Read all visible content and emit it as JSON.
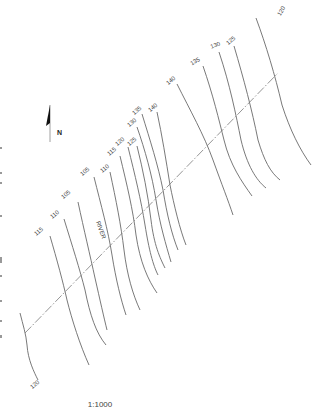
{
  "map": {
    "title": "Topographic contour map with cross-section line",
    "north_label": "N",
    "scale_label": "1:1000",
    "river_label": "RIVER",
    "colors": {
      "contour": "#6a6a6a",
      "section_line": "#7a7a7a",
      "label": "#444444"
    },
    "section_line": {
      "x1": 25,
      "y1": 333,
      "x2": 278,
      "y2": 73
    },
    "contours": [
      {
        "id": "c120-top",
        "label": "120",
        "lx": 283,
        "ly": 12,
        "rot": -60,
        "d": "M256,18 C266,45 275,75 282,105 C290,130 300,150 311,165"
      },
      {
        "id": "c125-top",
        "label": "125",
        "lx": 232,
        "ly": 42,
        "rot": -40,
        "d": "M234,46 C244,80 252,110 258,140 C264,160 270,172 280,180"
      },
      {
        "id": "c130-top",
        "label": "130",
        "lx": 216,
        "ly": 47,
        "rot": -20,
        "d": "M219,52 C230,85 236,115 241,140 C247,165 256,180 266,188"
      },
      {
        "id": "c135-top",
        "label": "135",
        "lx": 196,
        "ly": 63,
        "rot": -30,
        "d": "M203,66 C213,95 219,120 224,140 C230,165 242,182 252,196"
      },
      {
        "id": "c140-top",
        "label": "140",
        "lx": 172,
        "ly": 82,
        "rot": -40,
        "d": "M177,84 C190,110 204,135 213,160 C222,185 228,200 233,215"
      },
      {
        "id": "c140-mid",
        "label": "140",
        "lx": 154,
        "ly": 109,
        "rot": -40,
        "d": "M157,112 C162,135 166,160 170,185 C174,205 180,230 186,245"
      },
      {
        "id": "c135-mid",
        "label": "135",
        "lx": 138,
        "ly": 112,
        "rot": -40,
        "d": "M142,114 C150,140 158,165 163,190 C167,215 172,235 178,250"
      },
      {
        "id": "c130-mid",
        "label": "130",
        "lx": 133,
        "ly": 124,
        "rot": -40,
        "d": "M137,127 C145,150 152,175 156,200 C160,225 166,245 171,262"
      },
      {
        "id": "c125-mid",
        "label": "125",
        "lx": 133,
        "ly": 143,
        "rot": -40,
        "d": "M137,146 C143,170 148,195 151,220 C154,245 160,258 165,268"
      },
      {
        "id": "c120-mid",
        "label": "120",
        "lx": 121,
        "ly": 143,
        "rot": -40,
        "d": "M128,147 C135,175 141,200 145,225 C149,250 153,265 158,275"
      },
      {
        "id": "c115-mid",
        "label": "115",
        "lx": 113,
        "ly": 153,
        "rot": -40,
        "d": "M120,156 C127,185 133,210 136,235 C140,262 148,280 157,293"
      },
      {
        "id": "c110-mid",
        "label": "110",
        "lx": 106,
        "ly": 170,
        "rot": -40,
        "d": "M110,172 C116,200 121,225 124,250 C127,275 133,295 140,310"
      },
      {
        "id": "c105-mid",
        "label": "105",
        "lx": 86,
        "ly": 173,
        "rot": -40,
        "d": "M94,177 C101,205 108,230 112,255 C116,280 121,300 126,315"
      },
      {
        "id": "c105-low",
        "label": "105",
        "lx": 67,
        "ly": 196,
        "rot": -40,
        "d": "M78,202 C84,230 90,255 95,278 C100,300 104,318 107,330"
      },
      {
        "id": "c110-low",
        "label": "110",
        "lx": 56,
        "ly": 216,
        "rot": -40,
        "d": "M64,219 C72,245 80,270 85,290 C90,315 96,333 106,345"
      },
      {
        "id": "c115-low",
        "label": "115",
        "lx": 40,
        "ly": 233,
        "rot": -40,
        "d": "M50,236 C57,260 63,282 67,300 C72,320 80,345 89,365"
      },
      {
        "id": "c120-low",
        "label": "120",
        "lx": 36,
        "ly": 386,
        "rot": -40,
        "d": "M20,313 C23,325 26,334 27,345 C28,360 34,372 38,380"
      }
    ]
  }
}
